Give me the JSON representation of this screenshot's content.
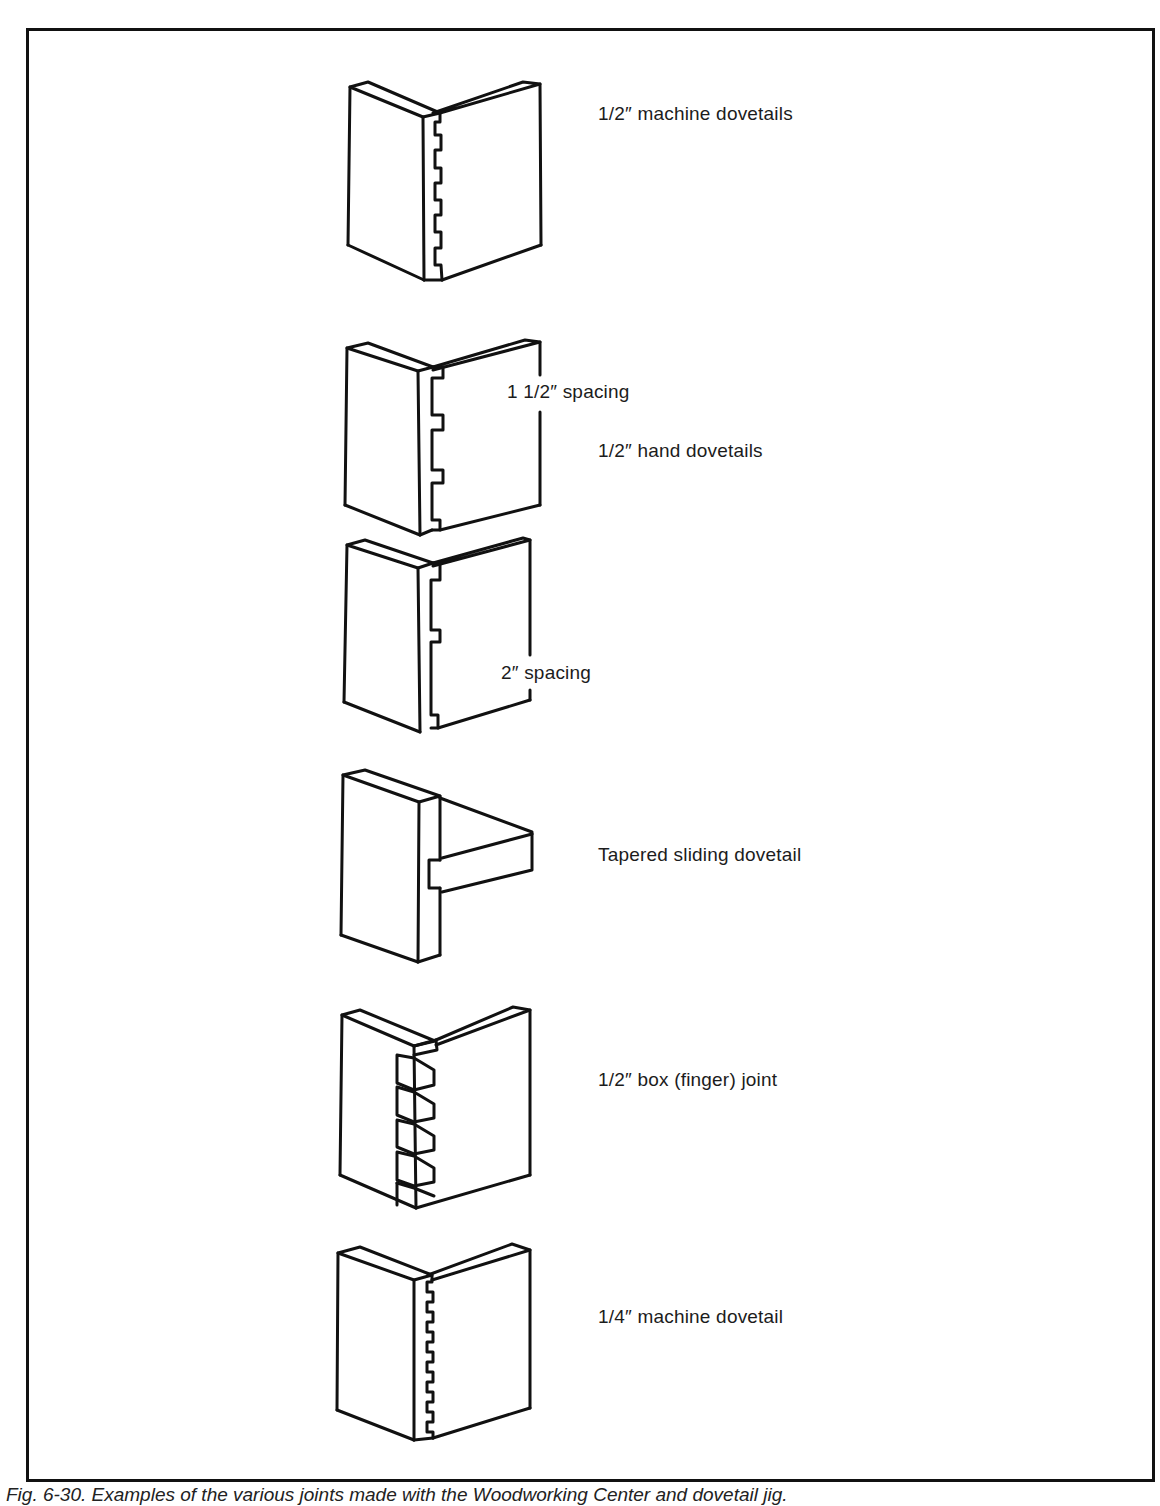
{
  "figure": {
    "frame": {
      "border_color": "#111111"
    },
    "joints": [
      {
        "id": "half-inch-machine-dovetails",
        "label": "1/2″ machine dovetails"
      },
      {
        "id": "half-inch-hand-dovetails-1-5",
        "label": "1/2″ hand dovetails",
        "annotation": "1 1/2″ spacing"
      },
      {
        "id": "half-inch-hand-dovetails-2",
        "annotation": "2″ spacing"
      },
      {
        "id": "tapered-sliding-dovetail",
        "label": "Tapered sliding dovetail"
      },
      {
        "id": "half-inch-box-joint",
        "label": "1/2″ box (finger) joint"
      },
      {
        "id": "quarter-inch-machine-dovetail",
        "label": "1/4″ machine dovetail"
      }
    ],
    "caption": "Fig. 6-30. Examples of the various joints made with the Woodworking Center and dovetail jig."
  }
}
